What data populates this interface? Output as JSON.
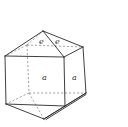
{
  "diagram": {
    "type": "crystal-form",
    "colors": {
      "background": "#ffffff",
      "edge": "#2a2a2a",
      "hidden_edge": "#6a6a6a",
      "label": "#333333"
    },
    "labels": [
      {
        "id": "e1",
        "text": "e",
        "x": 39,
        "y": 44
      },
      {
        "id": "e2",
        "text": "e",
        "x": 55,
        "y": 44
      },
      {
        "id": "a1",
        "text": "a",
        "x": 42,
        "y": 80
      },
      {
        "id": "a2",
        "text": "a",
        "x": 72,
        "y": 80
      }
    ]
  }
}
